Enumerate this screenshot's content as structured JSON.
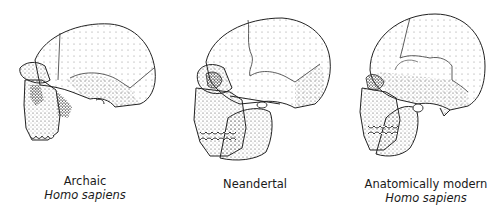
{
  "figure": {
    "panels": [
      {
        "id": "archaic",
        "name": "Archaic",
        "species": "Homo sapiens",
        "icon": "archaic-skull-illustration"
      },
      {
        "id": "neandertal",
        "name": "Neandertal",
        "species": "",
        "icon": "neandertal-skull-illustration"
      },
      {
        "id": "modern",
        "name": "Anatomically modern",
        "species": "Homo sapiens",
        "icon": "modern-skull-illustration"
      }
    ]
  }
}
